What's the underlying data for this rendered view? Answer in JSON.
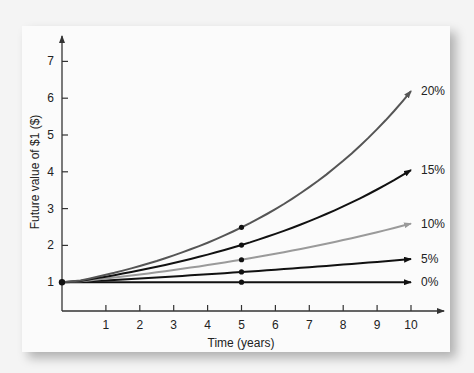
{
  "chart_data": {
    "type": "line",
    "title": "",
    "xlabel": "Time (years)",
    "ylabel": "Future value of $1 ($)",
    "x": [
      0,
      1,
      2,
      3,
      4,
      5,
      6,
      7,
      8,
      9,
      10
    ],
    "xticks": [
      "1",
      "2",
      "3",
      "4",
      "5",
      "6",
      "7",
      "8",
      "9",
      "10"
    ],
    "yticks": [
      "1",
      "2",
      "3",
      "4",
      "5",
      "6",
      "7"
    ],
    "xlim": [
      0,
      10.7
    ],
    "ylim": [
      0,
      7.6
    ],
    "grid": false,
    "legend": "inline labels at line ends",
    "series": [
      {
        "name": "0%",
        "rate": 0.0,
        "color": "#111111",
        "values": [
          1.0,
          1.0,
          1.0,
          1.0,
          1.0,
          1.0,
          1.0,
          1.0,
          1.0,
          1.0,
          1.0
        ]
      },
      {
        "name": "5%",
        "rate": 0.05,
        "color": "#111111",
        "values": [
          1.0,
          1.05,
          1.1,
          1.16,
          1.22,
          1.28,
          1.34,
          1.41,
          1.48,
          1.55,
          1.63
        ]
      },
      {
        "name": "10%",
        "rate": 0.1,
        "color": "#9a9a9a",
        "values": [
          1.0,
          1.1,
          1.21,
          1.33,
          1.46,
          1.61,
          1.77,
          1.95,
          2.14,
          2.36,
          2.59
        ]
      },
      {
        "name": "15%",
        "rate": 0.15,
        "color": "#111111",
        "values": [
          1.0,
          1.15,
          1.32,
          1.52,
          1.75,
          2.01,
          2.31,
          2.66,
          3.06,
          3.52,
          4.05
        ]
      },
      {
        "name": "20%",
        "rate": 0.2,
        "color": "#555555",
        "values": [
          1.0,
          1.2,
          1.44,
          1.73,
          2.07,
          2.49,
          2.99,
          3.58,
          4.3,
          5.16,
          6.19
        ]
      }
    ],
    "markers": [
      {
        "x": 0,
        "y": 1.0
      },
      {
        "x": 5,
        "y": 1.0
      },
      {
        "x": 5,
        "y": 1.28
      },
      {
        "x": 5,
        "y": 1.61
      },
      {
        "x": 5,
        "y": 2.01
      },
      {
        "x": 5,
        "y": 2.49
      }
    ]
  }
}
